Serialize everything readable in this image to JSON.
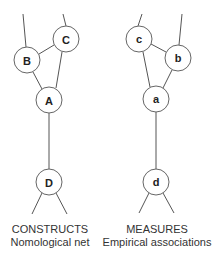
{
  "diagram": {
    "constructs": {
      "title": "CONSTRUCTS",
      "subtitle": "Nomological net",
      "nodes": {
        "A": {
          "label": "A",
          "cx": 49,
          "cy": 100
        },
        "B": {
          "label": "B",
          "cx": 27,
          "cy": 60
        },
        "C": {
          "label": "C",
          "cx": 66,
          "cy": 39
        },
        "D": {
          "label": "D",
          "cx": 49,
          "cy": 182
        }
      }
    },
    "measures": {
      "title": "MEASURES",
      "subtitle": "Empirical associations",
      "nodes": {
        "a": {
          "label": "a",
          "cx": 156,
          "cy": 99
        },
        "b": {
          "label": "b",
          "cx": 178,
          "cy": 58
        },
        "c": {
          "label": "c",
          "cx": 139,
          "cy": 39
        },
        "d": {
          "label": "d",
          "cx": 156,
          "cy": 182
        }
      }
    },
    "node_radius": 13,
    "colors": {
      "stroke": "#666666",
      "text": "#222222",
      "background": "#ffffff"
    }
  }
}
